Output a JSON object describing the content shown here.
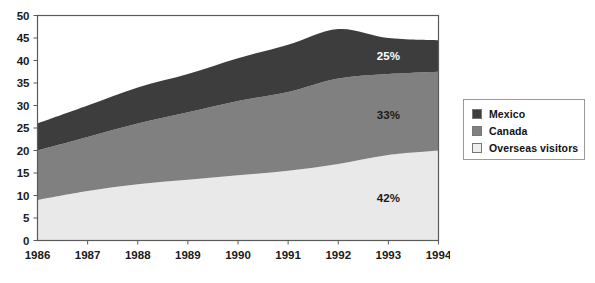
{
  "chart_data": {
    "type": "area",
    "stacked": true,
    "title": "",
    "subtitle": "",
    "xlabel": "",
    "ylabel": "",
    "categories": [
      "1986",
      "1987",
      "1988",
      "1989",
      "1990",
      "1991",
      "1992",
      "1993",
      "1994"
    ],
    "x": [
      1986,
      1987,
      1988,
      1989,
      1990,
      1991,
      1992,
      1993,
      1994
    ],
    "ylim": [
      0,
      50
    ],
    "yticks": [
      0,
      5,
      10,
      15,
      20,
      25,
      30,
      35,
      40,
      45,
      50
    ],
    "ytick_labels": [
      "0",
      "5",
      "10",
      "15",
      "20",
      "25",
      "30",
      "35",
      "40",
      "45",
      "50"
    ],
    "grid": false,
    "legend_position": "right",
    "series": [
      {
        "name": "Overseas visitors",
        "color": "#e9e9e9",
        "values": [
          9,
          11,
          12.5,
          13.5,
          14.5,
          15.5,
          17,
          19,
          20
        ],
        "cumulative": [
          9,
          11,
          12.5,
          13.5,
          14.5,
          15.5,
          17,
          19,
          20
        ]
      },
      {
        "name": "Canada",
        "color": "#808080",
        "values": [
          11,
          12,
          13.5,
          15,
          16.5,
          17.5,
          19,
          18,
          17.5
        ],
        "cumulative": [
          20,
          23,
          26,
          28.5,
          31,
          33,
          36,
          37,
          37.5
        ]
      },
      {
        "name": "Mexico",
        "color": "#3d3d3d",
        "values": [
          6,
          7,
          8,
          8.5,
          9.5,
          10.5,
          11,
          8,
          7
        ],
        "cumulative": [
          26,
          30,
          34,
          37,
          40.5,
          43.5,
          47,
          45,
          44.5
        ]
      }
    ],
    "annotations": [
      {
        "text": "25%",
        "series": "Mexico",
        "x": 1993,
        "on_dark": true
      },
      {
        "text": "33%",
        "series": "Canada",
        "x": 1993,
        "on_dark": false
      },
      {
        "text": "42%",
        "series": "Overseas visitors",
        "x": 1993,
        "on_dark": false
      }
    ]
  },
  "legend": {
    "items": [
      {
        "label": "Mexico",
        "color": "#3d3d3d"
      },
      {
        "label": "Canada",
        "color": "#808080"
      },
      {
        "label": "Overseas visitors",
        "color": "#eeeeee"
      }
    ]
  },
  "axes": {
    "y_tick_labels": [
      "50",
      "45",
      "40",
      "35",
      "30",
      "25",
      "20",
      "15",
      "10",
      "5",
      "0"
    ],
    "x_tick_labels": [
      "1986",
      "1987",
      "1988",
      "1989",
      "1990",
      "1991",
      "1992",
      "1993",
      "1994"
    ]
  },
  "annotations": {
    "mexico_pct": "25%",
    "canada_pct": "33%",
    "overseas_pct": "42%"
  }
}
